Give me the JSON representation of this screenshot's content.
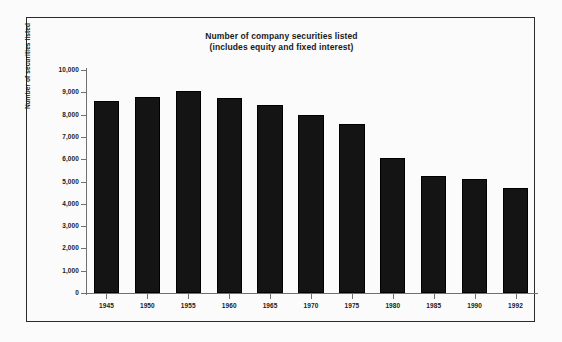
{
  "chart_data": {
    "type": "bar",
    "title": "Number of company securities listed (includes equity and fixed interest)",
    "title_lines": [
      "Number of company securities listed",
      "(includes equity and fixed interest)"
    ],
    "xlabel": "",
    "ylabel": "Number of securities listed",
    "categories": [
      "1945",
      "1950",
      "1955",
      "1960",
      "1965",
      "1970",
      "1975",
      "1980",
      "1985",
      "1990",
      "1992"
    ],
    "values": [
      8600,
      8800,
      9050,
      8750,
      8450,
      7980,
      7600,
      6050,
      5250,
      5100,
      4700
    ],
    "ylim": [
      0,
      10000
    ],
    "ytick_values": [
      0,
      1000,
      2000,
      3000,
      4000,
      5000,
      6000,
      7000,
      8000,
      9000,
      10000
    ],
    "ytick_labels": [
      "0",
      "1,000",
      "2,000",
      "3,000",
      "4,000",
      "5,000",
      "6,000",
      "7,000",
      "8,000",
      "9,000",
      "10,000"
    ],
    "grid": false,
    "legend": null,
    "series": [
      {
        "name": "Number of securities listed",
        "color": "#141414",
        "values": [
          8600,
          8800,
          9050,
          8750,
          8450,
          7980,
          7600,
          6050,
          5250,
          5100,
          4700
        ]
      }
    ]
  },
  "figure": {
    "background_color": "#fbfbfb",
    "frame_color": "#2b2b2b",
    "axis_color": "#707070",
    "bar_color": "#141414",
    "text_color": "#1a1a1a"
  }
}
